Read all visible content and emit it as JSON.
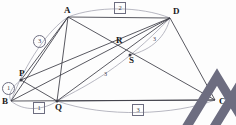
{
  "figure": {
    "type": "geometry-diagram",
    "title": "",
    "background": "#fdfdfd",
    "stroke_dark": "#3b3b45",
    "stroke_light": "#9a9aa8",
    "label_color": "#1a1a1a"
  },
  "points": [
    {
      "name": "A",
      "x": 68,
      "y": 17,
      "label": "A",
      "label_dx": -4,
      "label_dy": -11,
      "dot": false
    },
    {
      "name": "D",
      "x": 170,
      "y": 18,
      "label": "D",
      "label_dx": 3,
      "label_dy": -11,
      "dot": false
    },
    {
      "name": "B",
      "x": 11,
      "y": 101,
      "label": "B",
      "label_dx": -9,
      "label_dy": -4,
      "dot": false
    },
    {
      "name": "C",
      "x": 215,
      "y": 100,
      "label": "C",
      "label_dx": 4,
      "label_dy": -3,
      "dot": false
    },
    {
      "name": "P",
      "x": 21,
      "y": 80,
      "label": "P",
      "label_dx": -2,
      "label_dy": -11,
      "dot": true
    },
    {
      "name": "Q",
      "x": 57,
      "y": 101,
      "label": "Q",
      "label_dx": -2,
      "label_dy": 2,
      "dot": true
    },
    {
      "name": "R",
      "x": 118,
      "y": 47,
      "label": "R",
      "label_dx": -2,
      "label_dy": -11,
      "dot": false
    },
    {
      "name": "S",
      "x": 130,
      "y": 55,
      "label": "S",
      "label_dx": -1,
      "label_dy": 1,
      "dot": true
    }
  ],
  "segments": [
    {
      "name": "A-D",
      "from": "A",
      "to": "D",
      "weight": "dark"
    },
    {
      "name": "A-B",
      "from": "A",
      "to": "B",
      "weight": "dark"
    },
    {
      "name": "A-Q",
      "from": "A",
      "to": "Q",
      "weight": "dark"
    },
    {
      "name": "A-C",
      "from": "A",
      "to": "C",
      "weight": "dark"
    },
    {
      "name": "A-P",
      "from": "A",
      "to": "P",
      "weight": "dark"
    },
    {
      "name": "B-C",
      "from": "B",
      "to": "C",
      "weight": "dark"
    },
    {
      "name": "D-C",
      "from": "D",
      "to": "C",
      "weight": "dark"
    },
    {
      "name": "D-Q",
      "from": "D",
      "to": "Q",
      "weight": "dark"
    },
    {
      "name": "D-P",
      "from": "D",
      "to": "P",
      "weight": "dark"
    },
    {
      "name": "D-B",
      "from": "D",
      "to": "B",
      "weight": "dark"
    },
    {
      "name": "P-Q",
      "from": "P",
      "to": "Q",
      "weight": "dark"
    },
    {
      "name": "Q-C",
      "from": "Q",
      "to": "C",
      "weight": "dark"
    }
  ],
  "arcs": [
    {
      "name": "arc-A-D-top",
      "d": "M 68 17 C 96 6 140 6 170 18",
      "weight": "light"
    },
    {
      "name": "arc-B-A-left",
      "d": "M 11 101 C 26 62 48 30 68 17",
      "weight": "light"
    },
    {
      "name": "arc-P-B-small",
      "d": "M 21 80 C 10 88 8 96 11 101",
      "weight": "light"
    },
    {
      "name": "arc-B-Q-low",
      "d": "M 11 101 C 24 112 44 110 57 101",
      "weight": "light"
    },
    {
      "name": "arc-Q-C-low",
      "d": "M 57 101 C 105 118 175 115 215 100",
      "weight": "light"
    },
    {
      "name": "arc-Q-S-D",
      "d": "M 57 101 C 90 84 122 68 170 18",
      "weight": "light"
    },
    {
      "name": "arc-S-D-right",
      "d": "M 130 55 C 152 50 166 36 170 18",
      "weight": "light"
    }
  ],
  "markers": [
    {
      "name": "marker-circle-1",
      "shape": "circle",
      "text": "1",
      "x": 2,
      "y": 82
    },
    {
      "name": "marker-circle-3",
      "shape": "circle",
      "text": "3",
      "x": 33,
      "y": 35
    },
    {
      "name": "marker-box-1",
      "shape": "box",
      "text": "1",
      "x": 33,
      "y": 102
    },
    {
      "name": "marker-box-2",
      "shape": "box",
      "text": "2",
      "x": 114,
      "y": 2
    },
    {
      "name": "marker-box-3",
      "shape": "box",
      "text": "3",
      "x": 132,
      "y": 104
    },
    {
      "name": "marker-tri-3-a",
      "shape": "triangle",
      "text": "3",
      "x": 99,
      "y": 68
    },
    {
      "name": "marker-tri-3-b",
      "shape": "triangle",
      "text": "3",
      "x": 148,
      "y": 33
    }
  ]
}
